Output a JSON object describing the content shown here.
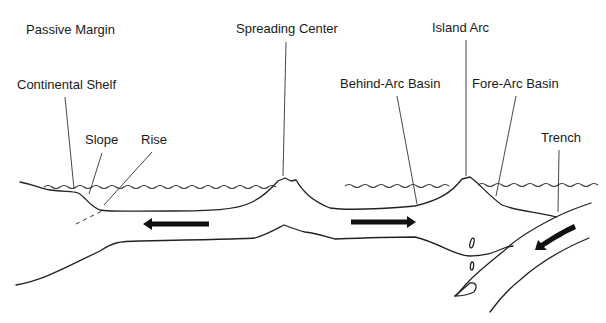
{
  "labels": {
    "passive_margin": "Passive Margin",
    "continental_shelf": "Continental Shelf",
    "slope": "Slope",
    "rise": "Rise",
    "spreading_center": "Spreading Center",
    "island_arc": "Island Arc",
    "behind_arc_basin": "Behind-Arc Basin",
    "fore_arc_basin": "Fore-Arc Basin",
    "trench": "Trench"
  },
  "arrows": [
    {
      "name": "plate-motion-left",
      "direction": "left"
    },
    {
      "name": "plate-motion-right",
      "direction": "right"
    },
    {
      "name": "subduction-motion",
      "direction": "down-left"
    }
  ],
  "colors": {
    "line": "#222222",
    "text": "#1a1a1a",
    "background": "#ffffff"
  }
}
